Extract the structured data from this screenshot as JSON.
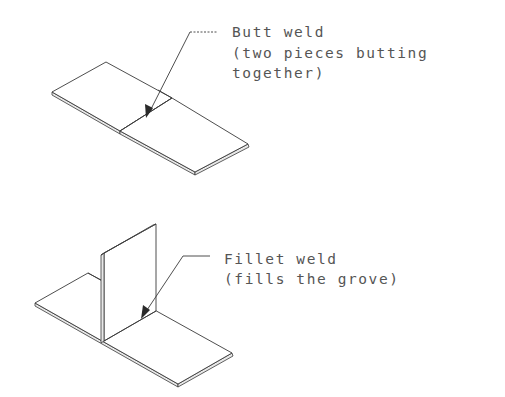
{
  "diagram": {
    "butt_weld": {
      "title": "Butt weld",
      "description_line1": "(two pieces butting",
      "description_line2": "together)"
    },
    "fillet_weld": {
      "title": "Fillet weld",
      "description_line1": "(fills the grove)"
    }
  },
  "colors": {
    "line": "#3a3a3a",
    "text": "#555555",
    "background": "#ffffff"
  }
}
